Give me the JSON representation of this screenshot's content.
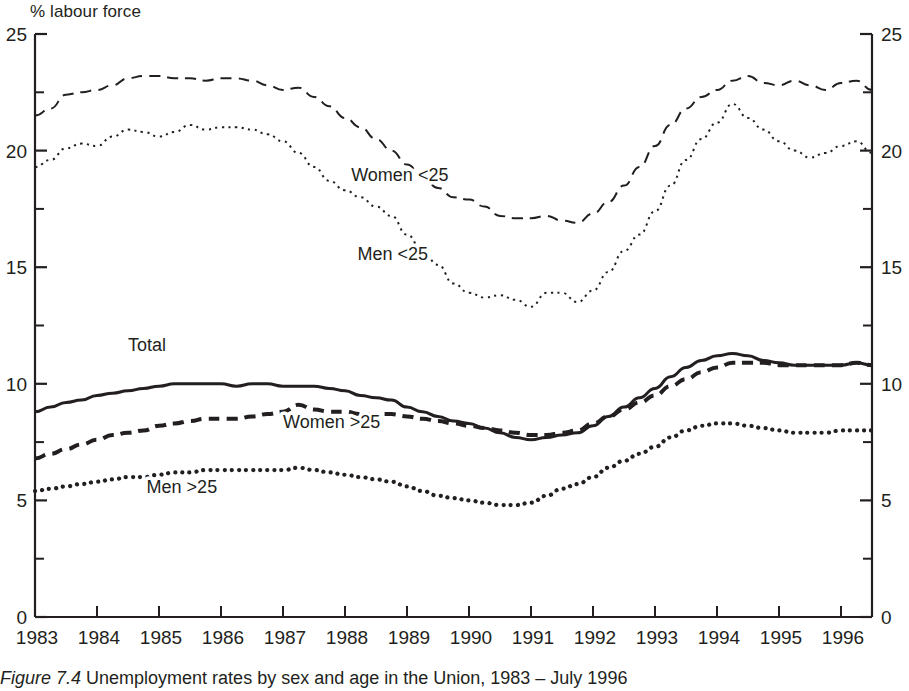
{
  "figure": {
    "caption_number": "Figure 7.4",
    "caption_text": "Unemployment rates by sex and age in the Union, 1983 – July 1996",
    "y_axis_unit_label": "% labour force"
  },
  "chart_data": {
    "type": "line",
    "title": "Unemployment rates by sex and age in the Union, 1983 – July 1996",
    "xlabel": "",
    "ylabel": "% labour force",
    "ylim": [
      0,
      25
    ],
    "xlim": [
      1983,
      1996.5
    ],
    "grid": false,
    "legend": "inline-labels",
    "y_ticks_major": [
      "0",
      "5",
      "10",
      "15",
      "20",
      "25"
    ],
    "y_ticks_minor": [
      2.5,
      7.5,
      12.5,
      17.5,
      22.5
    ],
    "y_axis_left_labels": [
      "25",
      "20",
      "15",
      "10",
      "5",
      "0"
    ],
    "y_axis_right_labels": [
      "25",
      "20",
      "15",
      "10",
      "5",
      "0"
    ],
    "x_tick_labels": [
      "1983",
      "1984",
      "1985",
      "1986",
      "1987",
      "1988",
      "1989",
      "1990",
      "1991",
      "1992",
      "1993",
      "1994",
      "1995",
      "1996"
    ],
    "x": [
      1983.0,
      1983.25,
      1983.5,
      1983.75,
      1984.0,
      1984.25,
      1984.5,
      1984.75,
      1985.0,
      1985.25,
      1985.5,
      1985.75,
      1986.0,
      1986.25,
      1986.5,
      1986.75,
      1987.0,
      1987.25,
      1987.5,
      1987.75,
      1988.0,
      1988.25,
      1988.5,
      1988.75,
      1989.0,
      1989.25,
      1989.5,
      1989.75,
      1990.0,
      1990.25,
      1990.5,
      1990.75,
      1991.0,
      1991.25,
      1991.5,
      1991.75,
      1992.0,
      1992.25,
      1992.5,
      1992.75,
      1993.0,
      1993.25,
      1993.5,
      1993.75,
      1994.0,
      1994.25,
      1994.5,
      1994.75,
      1995.0,
      1995.25,
      1995.5,
      1995.75,
      1996.0,
      1996.25,
      1996.5
    ],
    "series": [
      {
        "name": "Women <25",
        "label": "Women <25",
        "style": "dashed",
        "label_position": {
          "x": 1988.1,
          "y": 18.7
        },
        "values": [
          21.5,
          21.8,
          22.4,
          22.5,
          22.6,
          22.8,
          23.1,
          23.2,
          23.2,
          23.1,
          23.1,
          23.0,
          23.1,
          23.1,
          23.0,
          22.8,
          22.6,
          22.7,
          22.3,
          21.9,
          21.4,
          21.0,
          20.5,
          20.0,
          19.4,
          18.9,
          18.4,
          18.0,
          17.9,
          17.6,
          17.2,
          17.1,
          17.1,
          17.2,
          17.0,
          16.9,
          17.3,
          17.8,
          18.5,
          19.3,
          20.2,
          21.1,
          21.8,
          22.3,
          22.6,
          23.0,
          23.2,
          22.9,
          22.8,
          23.0,
          22.8,
          22.6,
          22.9,
          23.0,
          22.6
        ]
      },
      {
        "name": "Men <25",
        "label": "Men <25",
        "style": "dotted",
        "label_position": {
          "x": 1988.2,
          "y": 15.3
        },
        "values": [
          19.3,
          19.6,
          20.1,
          20.3,
          20.2,
          20.6,
          20.9,
          20.8,
          20.6,
          20.8,
          21.1,
          20.9,
          21.0,
          21.0,
          20.9,
          20.7,
          20.4,
          19.9,
          19.3,
          18.7,
          18.3,
          18.0,
          17.6,
          17.2,
          16.4,
          15.7,
          15.1,
          14.3,
          13.9,
          13.7,
          13.8,
          13.6,
          13.3,
          13.9,
          13.9,
          13.5,
          14.0,
          14.8,
          15.7,
          16.4,
          17.4,
          18.5,
          19.6,
          20.5,
          21.2,
          22.0,
          21.4,
          20.9,
          20.4,
          20.0,
          19.7,
          19.9,
          20.2,
          20.4,
          19.9
        ]
      },
      {
        "name": "Total",
        "label": "Total",
        "style": "solid",
        "label_position": {
          "x": 1984.5,
          "y": 11.4
        },
        "values": [
          8.8,
          9.0,
          9.2,
          9.3,
          9.5,
          9.6,
          9.7,
          9.8,
          9.9,
          10.0,
          10.0,
          10.0,
          10.0,
          9.9,
          10.0,
          10.0,
          9.9,
          9.9,
          9.9,
          9.8,
          9.7,
          9.5,
          9.4,
          9.3,
          9.0,
          8.8,
          8.6,
          8.4,
          8.3,
          8.1,
          7.9,
          7.7,
          7.6,
          7.7,
          7.8,
          7.9,
          8.2,
          8.6,
          9.0,
          9.4,
          9.8,
          10.3,
          10.7,
          11.0,
          11.2,
          11.3,
          11.2,
          11.0,
          10.9,
          10.8,
          10.8,
          10.8,
          10.8,
          10.9,
          10.8
        ]
      },
      {
        "name": "Women >25",
        "label": "Women >25",
        "style": "dashed-bold",
        "label_position": {
          "x": 1987.0,
          "y": 8.1
        },
        "values": [
          6.8,
          7.0,
          7.2,
          7.4,
          7.6,
          7.8,
          7.9,
          8.0,
          8.2,
          8.3,
          8.4,
          8.5,
          8.5,
          8.5,
          8.6,
          8.7,
          8.8,
          9.1,
          8.9,
          8.8,
          8.8,
          8.7,
          8.7,
          8.7,
          8.6,
          8.5,
          8.4,
          8.3,
          8.2,
          8.1,
          8.0,
          7.9,
          7.8,
          7.8,
          7.9,
          8.0,
          8.3,
          8.6,
          8.9,
          9.2,
          9.5,
          9.9,
          10.2,
          10.5,
          10.7,
          10.9,
          10.9,
          10.9,
          10.8,
          10.8,
          10.8,
          10.8,
          10.8,
          10.9,
          10.8
        ]
      },
      {
        "name": "Men >25",
        "label": "Men >25",
        "style": "dotted-bold",
        "label_position": {
          "x": 1984.8,
          "y": 5.3
        },
        "values": [
          5.4,
          5.5,
          5.6,
          5.7,
          5.8,
          5.9,
          6.0,
          6.0,
          6.1,
          6.2,
          6.2,
          6.3,
          6.3,
          6.3,
          6.3,
          6.3,
          6.3,
          6.4,
          6.3,
          6.2,
          6.1,
          6.0,
          5.9,
          5.8,
          5.6,
          5.4,
          5.2,
          5.1,
          5.0,
          4.9,
          4.8,
          4.8,
          4.9,
          5.2,
          5.5,
          5.7,
          6.0,
          6.4,
          6.7,
          7.0,
          7.3,
          7.7,
          8.0,
          8.2,
          8.3,
          8.3,
          8.2,
          8.1,
          8.0,
          7.9,
          7.9,
          7.9,
          8.0,
          8.0,
          8.0
        ]
      }
    ]
  },
  "colors": {
    "ink": "#231f20",
    "background": "#ffffff"
  }
}
